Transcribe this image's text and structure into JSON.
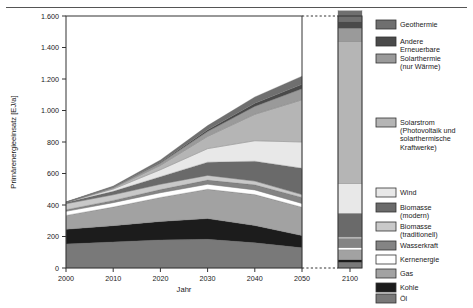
{
  "figure": {
    "background": "#ffffff",
    "rule_color": "#555555"
  },
  "axes": {
    "ylabel": "Primärenergieeinsatz [EJ/a]",
    "xlabel": "Jahr",
    "yticks": [
      "0",
      "200",
      "400",
      "600",
      "800",
      "1.000",
      "1.200",
      "1.400",
      "1.600"
    ],
    "ytick_values": [
      0,
      200,
      400,
      600,
      800,
      1000,
      1200,
      1400,
      1600
    ],
    "ylim": [
      0,
      1600
    ],
    "xticks_left": [
      "2000",
      "2010",
      "2020",
      "2030",
      "2040",
      "2050"
    ],
    "xtick_values_left": [
      2000,
      2010,
      2020,
      2030,
      2040,
      2050
    ],
    "xticks_right": [
      "2100"
    ],
    "xlim_left": [
      2000,
      2050
    ],
    "axis_break": true,
    "grid": false
  },
  "legend": {
    "position": "right",
    "items": [
      {
        "label": "Geothermie",
        "color": "#6f6f6f"
      },
      {
        "label": "Andere\nErneuerbare",
        "color": "#4a4a4a"
      },
      {
        "label": "Solarthermie\n(nur Wärme)",
        "color": "#9a9a9a"
      },
      {
        "label": "Solarstrom\n(Photovoltaik und\nsolarthermische\nKraftwerke)",
        "color": "#b5b5b5"
      },
      {
        "label": "Wind",
        "color": "#e8e8e8"
      },
      {
        "label": "Biomasse\n(modern)",
        "color": "#6a6a6a"
      },
      {
        "label": "Biomasse\n(traditionell)",
        "color": "#c9c9c9"
      },
      {
        "label": "Wasserkraft",
        "color": "#848484"
      },
      {
        "label": "Kernenergie",
        "color": "#ffffff"
      },
      {
        "label": "Gas",
        "color": "#a2a2a2"
      },
      {
        "label": "Kohle",
        "color": "#1c1c1c"
      },
      {
        "label": "Öl",
        "color": "#797979"
      }
    ]
  },
  "chart_data": {
    "type": "area",
    "stacked": true,
    "title": "",
    "xlabel": "Jahr",
    "ylabel": "Primärenergieeinsatz [EJ/a]",
    "ylim": [
      0,
      1600
    ],
    "x": [
      2000,
      2010,
      2020,
      2030,
      2040,
      2050
    ],
    "x_right": [
      2100
    ],
    "series_order_bottom_to_top": [
      "Öl",
      "Kohle",
      "Gas",
      "Kernenergie",
      "Wasserkraft",
      "Biomasse (traditionell)",
      "Biomasse (modern)",
      "Wind",
      "Solarstrom (Photovoltaik und solarthermische Kraftwerke)",
      "Solarthermie (nur Wärme)",
      "Andere Erneuerbare",
      "Geothermie"
    ],
    "series": [
      {
        "name": "Öl",
        "color": "#797979",
        "values": [
          152,
          165,
          178,
          182,
          160,
          128
        ],
        "value_2100": 35
      },
      {
        "name": "Kohle",
        "color": "#1c1c1c",
        "values": [
          94,
          104,
          118,
          132,
          110,
          78
        ],
        "value_2100": 18
      },
      {
        "name": "Gas",
        "color": "#a2a2a2",
        "values": [
          88,
          118,
          152,
          186,
          196,
          180
        ],
        "value_2100": 62
      },
      {
        "name": "Kernenergie",
        "color": "#ffffff",
        "values": [
          26,
          28,
          30,
          32,
          30,
          24
        ],
        "value_2100": 14
      },
      {
        "name": "Wasserkraft",
        "color": "#848484",
        "values": [
          10,
          14,
          20,
          26,
          32,
          38
        ],
        "value_2100": 58
      },
      {
        "name": "Biomasse (traditionell)",
        "color": "#c9c9c9",
        "values": [
          38,
          36,
          34,
          30,
          24,
          18
        ],
        "value_2100": 10
      },
      {
        "name": "Biomasse (modern)",
        "color": "#6a6a6a",
        "values": [
          8,
          22,
          48,
          84,
          126,
          168
        ],
        "value_2100": 150
      },
      {
        "name": "Wind",
        "color": "#e8e8e8",
        "values": [
          1,
          14,
          44,
          86,
          130,
          166
        ],
        "value_2100": 190
      },
      {
        "name": "Solarstrom (Photovoltaik und solarthermische Kraftwerke)",
        "color": "#b5b5b5",
        "values": [
          0,
          6,
          28,
          78,
          168,
          268
        ],
        "value_2100": 900
      },
      {
        "name": "Solarthermie (nur Wärme)",
        "color": "#9a9a9a",
        "values": [
          1,
          5,
          14,
          30,
          50,
          70
        ],
        "value_2100": 86
      },
      {
        "name": "Andere Erneuerbare",
        "color": "#4a4a4a",
        "values": [
          0,
          2,
          6,
          12,
          20,
          28
        ],
        "value_2100": 44
      },
      {
        "name": "Geothermie",
        "color": "#6f6f6f",
        "values": [
          2,
          6,
          14,
          26,
          40,
          52
        ],
        "value_2100": 66
      }
    ],
    "totals": [
      420,
      520,
      686,
      904,
      1086,
      1218
    ],
    "total_2100": 1633
  }
}
